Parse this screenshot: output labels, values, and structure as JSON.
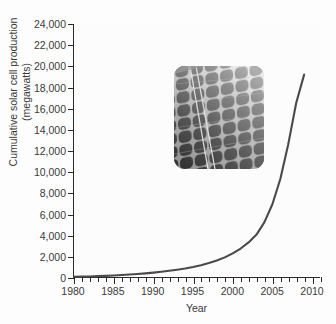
{
  "chart_data": {
    "type": "line",
    "title": "",
    "xlabel": "Year",
    "ylabel": "Cumulative solar cell production (megawatts)",
    "ylabel_line1": "Cumulative solar cell production",
    "ylabel_line2": "(megawatts)",
    "grid": false,
    "legend": false,
    "xlim": [
      1980,
      2011
    ],
    "ylim": [
      0,
      24000
    ],
    "x_major_ticks": [
      1980,
      1985,
      1990,
      1995,
      2000,
      2005,
      2010
    ],
    "x_minor_tick_step": 1,
    "y_tick_step": 2000,
    "y_tick_labels": [
      "24,000",
      "22,000",
      "20,000",
      "18,000",
      "16,000",
      "14,000",
      "12,000",
      "10,000",
      "8,000",
      "6,000",
      "4,000",
      "2,000",
      "0"
    ],
    "y_tick_values": [
      24000,
      22000,
      20000,
      18000,
      16000,
      14000,
      12000,
      10000,
      8000,
      6000,
      4000,
      2000,
      0
    ],
    "x_tick_labels": [
      "1980",
      "1985",
      "1990",
      "1995",
      "2000",
      "2005",
      "2010"
    ],
    "series": [
      {
        "name": "Cumulative solar cell production",
        "color": "#4a4a4a",
        "x": [
          1980,
          1981,
          1982,
          1983,
          1984,
          1985,
          1986,
          1987,
          1988,
          1989,
          1990,
          1991,
          1992,
          1993,
          1994,
          1995,
          1996,
          1997,
          1998,
          1999,
          2000,
          2001,
          2002,
          2003,
          2004,
          2005,
          2006,
          2007,
          2008,
          2009
        ],
        "values": [
          20,
          35,
          55,
          80,
          110,
          145,
          185,
          230,
          285,
          345,
          415,
          495,
          585,
          690,
          810,
          950,
          1120,
          1320,
          1560,
          1860,
          2240,
          2700,
          3280,
          4020,
          5200,
          6900,
          9300,
          12600,
          16500,
          19200
        ]
      }
    ],
    "annotations": [
      {
        "name": "solar-panel-photo-inset",
        "description": "Grayscale photograph of a solar panel array, rounded corners, placed inside the plot area upper-left"
      }
    ],
    "colors": {
      "line": "#4a4a4a",
      "axis": "#2a2a2a",
      "text": "#3a3a3a",
      "plot_background": "#fcfcfc",
      "figure_background": "#fdfdfd"
    }
  }
}
